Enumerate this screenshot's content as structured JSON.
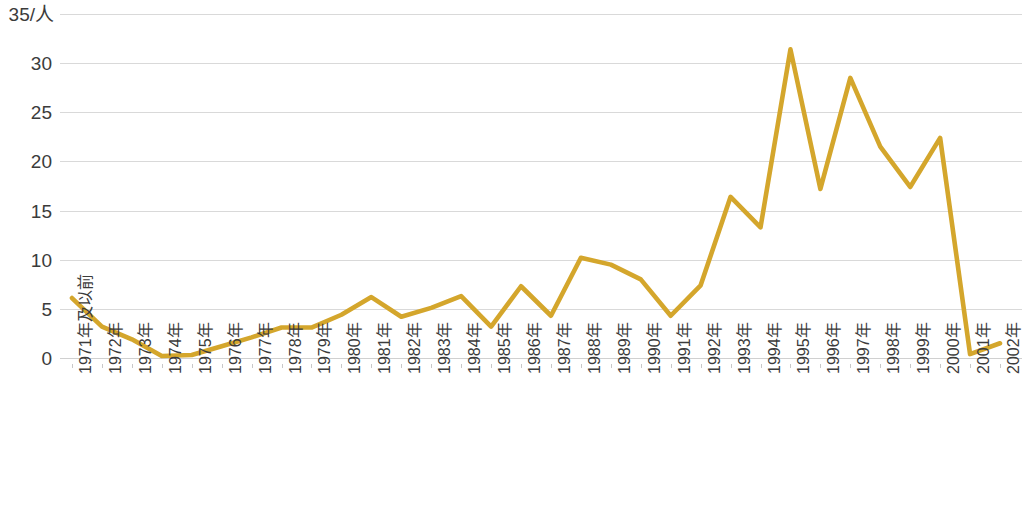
{
  "chart_data": {
    "type": "line",
    "title": "",
    "subtitle": "",
    "xlabel": "",
    "ylabel": "35/人",
    "unit_label": "35/人",
    "ylim": [
      0,
      35
    ],
    "ytick_values": [
      0,
      5,
      10,
      15,
      20,
      25,
      30,
      35
    ],
    "ytick_labels": [
      "0",
      "5",
      "10",
      "15",
      "20",
      "25",
      "30",
      "35/人"
    ],
    "grid": true,
    "grid_axis": "y",
    "legend": false,
    "legend_position": "none",
    "series_color": "#d4a62c",
    "grid_color": "#d9d9d9",
    "background_color": "#ffffff",
    "categories": [
      "1971年及以前",
      "1972年",
      "1973年",
      "1974年",
      "1975年",
      "1976年",
      "1977年",
      "1978年",
      "1979年",
      "1980年",
      "1981年",
      "1982年",
      "1983年",
      "1984年",
      "1985年",
      "1986年",
      "1987年",
      "1988年",
      "1989年",
      "1990年",
      "1991年",
      "1992年",
      "1993年",
      "1994年",
      "1995年",
      "1996年",
      "1997年",
      "1998年",
      "1999年",
      "2000年",
      "2001年",
      "2002年"
    ],
    "series": [
      {
        "name": "人数",
        "values": [
          6.1,
          3.2,
          1.9,
          0.2,
          0.3,
          1.2,
          2.1,
          3.1,
          3.1,
          4.4,
          6.2,
          4.2,
          5.1,
          6.3,
          3.2,
          7.3,
          4.3,
          10.2,
          9.5,
          8.0,
          4.3,
          7.4,
          16.4,
          13.3,
          31.4,
          17.2,
          28.5,
          21.5,
          17.4,
          22.4,
          0.4,
          1.5
        ]
      }
    ]
  }
}
